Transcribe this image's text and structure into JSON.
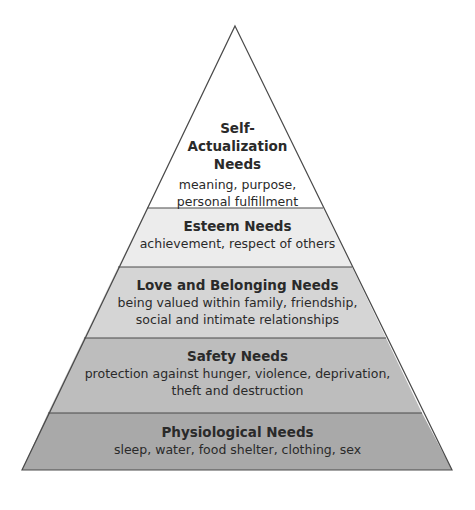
{
  "diagram": {
    "levels": [
      {
        "name": "Self-Actualization Needs",
        "title_lines": [
          "Self-",
          "Actualization",
          "Needs"
        ],
        "desc_lines": [
          "meaning, purpose,",
          "personal fulfillment"
        ],
        "fill": "#ffffff"
      },
      {
        "name": "Esteem Needs",
        "title_lines": [
          "Esteem Needs"
        ],
        "desc_lines": [
          "achievement, respect of others"
        ],
        "fill": "#ececec"
      },
      {
        "name": "Love and Belonging Needs",
        "title_lines": [
          "Love and Belonging Needs"
        ],
        "desc_lines": [
          "being valued within family, friendship,",
          "social and intimate relationships"
        ],
        "fill": "#d5d5d5"
      },
      {
        "name": "Safety Needs",
        "title_lines": [
          "Safety Needs"
        ],
        "desc_lines": [
          "protection against hunger, violence, deprivation,",
          "theft and destruction"
        ],
        "fill": "#bdbdbd"
      },
      {
        "name": "Physiological Needs",
        "title_lines": [
          "Physiological Needs"
        ],
        "desc_lines": [
          "sleep, water, food shelter, clothing, sex"
        ],
        "fill": "#a9a9a9"
      }
    ],
    "colors": {
      "outline": "#4a4a4a",
      "text": "#2a2a2a"
    }
  }
}
